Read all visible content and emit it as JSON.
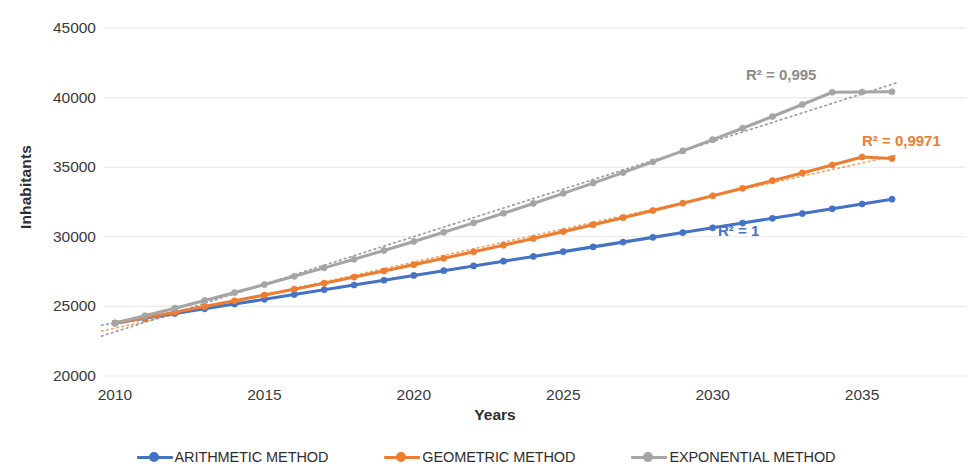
{
  "chart_data": {
    "type": "line",
    "title": "",
    "xlabel": "Years",
    "ylabel": "Inhabitants",
    "xlim": [
      2010,
      2036
    ],
    "ylim": [
      20000,
      45000
    ],
    "grid": true,
    "legend_position": "bottom",
    "xticks": [
      "2010",
      "2015",
      "2020",
      "2025",
      "2030",
      "2035"
    ],
    "yticks": [
      "20000",
      "25000",
      "30000",
      "35000",
      "40000",
      "45000"
    ],
    "x": [
      2010,
      2011,
      2012,
      2013,
      2014,
      2015,
      2016,
      2017,
      2018,
      2019,
      2020,
      2021,
      2022,
      2023,
      2024,
      2025,
      2026,
      2027,
      2028,
      2029,
      2030,
      2031,
      2032,
      2033,
      2034,
      2035,
      2036
    ],
    "series": [
      {
        "name": "ARITHMETIC METHOD",
        "color": "#4472C4",
        "r2_label": "R² = 1",
        "values": [
          23800,
          24142,
          24484,
          24827,
          25169,
          25511,
          25853,
          26196,
          26538,
          26880,
          27222,
          27565,
          27907,
          28249,
          28591,
          28934,
          29276,
          29618,
          29960,
          30303,
          30645,
          30987,
          31329,
          31672,
          32014,
          32356,
          32700
        ]
      },
      {
        "name": "GEOMETRIC METHOD",
        "color": "#ED7D31",
        "r2_label": "R² = 0,9971",
        "values": [
          23800,
          24190,
          24586,
          24989,
          25399,
          25815,
          26238,
          26668,
          27105,
          27549,
          28001,
          28460,
          28926,
          29400,
          29882,
          30372,
          30870,
          31376,
          31890,
          32413,
          32944,
          33484,
          34033,
          34591,
          35158,
          35734,
          35620
        ]
      },
      {
        "name": "EXPONENTIAL METHOD",
        "color": "#A5A5A5",
        "r2_label": "R² = 0,995",
        "values": [
          23800,
          24330,
          24872,
          25426,
          25992,
          26571,
          27163,
          27768,
          28386,
          29018,
          29665,
          30326,
          31001,
          31692,
          32398,
          33120,
          33858,
          34612,
          35383,
          36172,
          36978,
          37801,
          38644,
          39505,
          40385,
          40400,
          40420
        ]
      }
    ],
    "trendlines": [
      {
        "name": "arithmetic-trendline",
        "color": "#7f9ed4",
        "style": "dotted"
      },
      {
        "name": "geometric-trendline",
        "color": "#f0a463",
        "style": "dotted"
      },
      {
        "name": "exponential-trendline",
        "color": "#9a9a9a",
        "style": "dotted"
      }
    ]
  },
  "axes": {
    "y_title": "Inhabitants",
    "x_title": "Years",
    "y_ticks": [
      {
        "label": "45000",
        "value": 45000
      },
      {
        "label": "40000",
        "value": 40000
      },
      {
        "label": "35000",
        "value": 35000
      },
      {
        "label": "30000",
        "value": 30000
      },
      {
        "label": "25000",
        "value": 25000
      },
      {
        "label": "20000",
        "value": 20000
      }
    ],
    "x_ticks": [
      {
        "label": "2010",
        "value": 2010
      },
      {
        "label": "2015",
        "value": 2015
      },
      {
        "label": "2020",
        "value": 2020
      },
      {
        "label": "2025",
        "value": 2025
      },
      {
        "label": "2030",
        "value": 2030
      },
      {
        "label": "2035",
        "value": 2035
      }
    ]
  },
  "annotations": [
    {
      "id": "r2-exponential",
      "text": "R² = 0,995",
      "color": "#8c8c8c"
    },
    {
      "id": "r2-geometric",
      "text": "R² = 0,9971",
      "color": "#ED7D31"
    },
    {
      "id": "r2-arithmetic",
      "text": "R² = 1",
      "color": "#4472C4"
    }
  ],
  "legend": {
    "items": [
      {
        "label": "ARITHMETIC METHOD",
        "color": "#4472C4"
      },
      {
        "label": "GEOMETRIC METHOD",
        "color": "#ED7D31"
      },
      {
        "label": "EXPONENTIAL METHOD",
        "color": "#A5A5A5"
      }
    ]
  }
}
